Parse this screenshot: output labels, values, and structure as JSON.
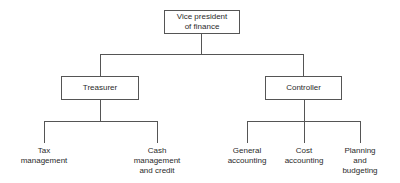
{
  "chart": {
    "root": {
      "label_line1": "Vice president",
      "label_line2": "of finance"
    },
    "managers": [
      {
        "label": "Treasurer",
        "reports": [
          {
            "line1": "Tax",
            "line2": "management",
            "line3": ""
          },
          {
            "line1": "Cash",
            "line2": "management",
            "line3": "and credit"
          }
        ]
      },
      {
        "label": "Controller",
        "reports": [
          {
            "line1": "General",
            "line2": "accounting",
            "line3": ""
          },
          {
            "line1": "Cost",
            "line2": "accounting",
            "line3": ""
          },
          {
            "line1": "Planning",
            "line2": "and",
            "line3": "budgeting"
          }
        ]
      }
    ]
  }
}
